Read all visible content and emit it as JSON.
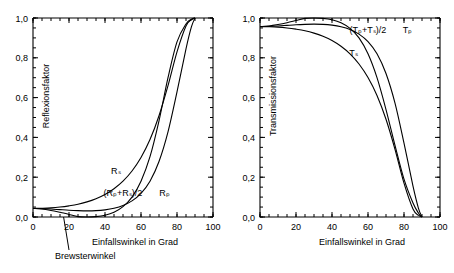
{
  "chart_data": [
    {
      "type": "line",
      "panel": "left",
      "title": "",
      "xlabel": "Einfallswinkel in Grad",
      "ylabel": "Reflexionsfaktor",
      "xlim": [
        0,
        100
      ],
      "ylim": [
        0.0,
        1.0
      ],
      "xticks": [
        0,
        20,
        40,
        60,
        80,
        100
      ],
      "xtick_labels": [
        "0",
        "20",
        "40",
        "60",
        "80",
        "100"
      ],
      "yticks": [
        0.0,
        0.2,
        0.4,
        0.6,
        0.8,
        1.0
      ],
      "ytick_labels": [
        "0,0",
        "0,2",
        "0,4",
        "0,6",
        "0,8",
        "1,0"
      ],
      "minor_tick_step_x": 5,
      "minor_tick_step_y": 0.05,
      "grid": false,
      "legend_position": "inline-curve-labels",
      "annotations": [
        {
          "text": "Brewsterwinkel",
          "points_to_x": 17,
          "points_to_y": 0.0
        }
      ],
      "series": [
        {
          "name": "R_s",
          "label": "Rₛ",
          "label_x": 46,
          "label_y": 0.215,
          "x": [
            0,
            5,
            10,
            15,
            20,
            25,
            30,
            35,
            40,
            45,
            50,
            55,
            60,
            65,
            70,
            75,
            80,
            85,
            88,
            90
          ],
          "values": [
            0.043,
            0.044,
            0.046,
            0.05,
            0.056,
            0.064,
            0.076,
            0.092,
            0.113,
            0.142,
            0.18,
            0.231,
            0.299,
            0.389,
            0.509,
            0.66,
            0.83,
            0.96,
            0.991,
            1.0
          ]
        },
        {
          "name": "(R_p+R_s)/2",
          "label": "(Rₚ+Rₛ)/2",
          "label_x": 50,
          "label_y": 0.105,
          "x": [
            0,
            5,
            10,
            15,
            20,
            25,
            30,
            35,
            40,
            45,
            50,
            55,
            60,
            65,
            70,
            75,
            80,
            85,
            88,
            90
          ],
          "values": [
            0.043,
            0.042,
            0.04,
            0.037,
            0.034,
            0.032,
            0.031,
            0.032,
            0.036,
            0.044,
            0.058,
            0.081,
            0.119,
            0.18,
            0.279,
            0.428,
            0.629,
            0.845,
            0.955,
            1.0
          ]
        },
        {
          "name": "R_p",
          "label": "Rₚ",
          "label_x": 73,
          "label_y": 0.105,
          "x": [
            0,
            5,
            10,
            15,
            17,
            20,
            25,
            30,
            35,
            40,
            45,
            50,
            55,
            60,
            65,
            70,
            75,
            80,
            85,
            88,
            90
          ],
          "values": [
            0.043,
            0.04,
            0.033,
            0.024,
            0.02,
            0.013,
            0.002,
            0.0,
            0.002,
            0.009,
            0.024,
            0.052,
            0.1,
            0.18,
            0.303,
            0.483,
            0.7,
            0.88,
            0.97,
            0.994,
            1.0
          ]
        }
      ]
    },
    {
      "type": "line",
      "panel": "right",
      "title": "",
      "xlabel": "Einfallswinkel in Grad",
      "ylabel": "Transmissionsfaktor",
      "xlim": [
        0,
        100
      ],
      "ylim": [
        0.0,
        1.0
      ],
      "xticks": [
        0,
        20,
        40,
        60,
        80,
        100
      ],
      "xtick_labels": [
        "0",
        "20",
        "40",
        "60",
        "80",
        "100"
      ],
      "yticks": [
        0.0,
        0.2,
        0.4,
        0.6,
        0.8,
        1.0
      ],
      "ytick_labels": [
        "0,0",
        "0,2",
        "0,4",
        "0,6",
        "0,8",
        "1,0"
      ],
      "minor_tick_step_x": 5,
      "minor_tick_step_y": 0.05,
      "grid": false,
      "legend_position": "inline-curve-labels",
      "annotations": [],
      "series": [
        {
          "name": "T_p",
          "label": "Tₚ",
          "label_x": 82,
          "label_y": 0.925,
          "x": [
            0,
            5,
            10,
            15,
            20,
            25,
            30,
            35,
            40,
            45,
            50,
            55,
            60,
            65,
            70,
            75,
            80,
            85,
            88,
            90
          ],
          "values": [
            0.957,
            0.96,
            0.967,
            0.976,
            0.987,
            0.998,
            1.0,
            0.998,
            0.991,
            0.976,
            0.948,
            0.9,
            0.82,
            0.7,
            0.54,
            0.36,
            0.19,
            0.07,
            0.02,
            0.0
          ]
        },
        {
          "name": "(T_p+T_s)/2",
          "label": "(Tₚ+Tₛ)/2",
          "label_x": 60,
          "label_y": 0.925,
          "x": [
            0,
            5,
            10,
            15,
            20,
            25,
            30,
            35,
            40,
            45,
            50,
            55,
            60,
            65,
            70,
            75,
            80,
            85,
            88,
            90
          ],
          "values": [
            0.957,
            0.958,
            0.96,
            0.963,
            0.966,
            0.968,
            0.969,
            0.968,
            0.964,
            0.956,
            0.942,
            0.919,
            0.881,
            0.82,
            0.721,
            0.572,
            0.371,
            0.155,
            0.045,
            0.0
          ]
        },
        {
          "name": "T_s",
          "label": "Tₛ",
          "label_x": 52,
          "label_y": 0.81,
          "x": [
            0,
            5,
            10,
            15,
            20,
            25,
            30,
            35,
            40,
            45,
            50,
            55,
            60,
            65,
            70,
            75,
            80,
            85,
            88,
            90
          ],
          "values": [
            0.957,
            0.956,
            0.954,
            0.95,
            0.944,
            0.936,
            0.924,
            0.908,
            0.887,
            0.858,
            0.82,
            0.769,
            0.701,
            0.611,
            0.491,
            0.34,
            0.17,
            0.04,
            0.009,
            0.0
          ]
        }
      ]
    }
  ]
}
